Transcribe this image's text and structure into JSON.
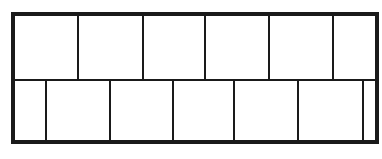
{
  "figure": {
    "caption": "",
    "background_color": "#ffffff",
    "stroke_color": "#1a1a1a",
    "outer_stroke_width": 3.2,
    "inner_stroke_width": 2.2,
    "bounds": {
      "left": 13,
      "top": 14,
      "right": 377,
      "bottom": 142,
      "width": 364,
      "height": 128
    },
    "horizontal_dividers": [
      {
        "name": "middle-divider",
        "y": 80
      }
    ],
    "rows": [
      {
        "name": "upper-row",
        "top": 14,
        "bottom": 80,
        "cell_count": 6,
        "dividers": [
          78,
          143,
          205,
          269,
          333
        ],
        "cells": [
          {
            "name": "upper-cell-1",
            "left": 13,
            "right": 78,
            "width": 65
          },
          {
            "name": "upper-cell-2",
            "left": 78,
            "right": 143,
            "width": 65
          },
          {
            "name": "upper-cell-3",
            "left": 143,
            "right": 205,
            "width": 62
          },
          {
            "name": "upper-cell-4",
            "left": 205,
            "right": 269,
            "width": 64
          },
          {
            "name": "upper-cell-5",
            "left": 269,
            "right": 333,
            "width": 64
          },
          {
            "name": "upper-cell-6",
            "left": 333,
            "right": 377,
            "width": 44
          }
        ]
      },
      {
        "name": "lower-row",
        "top": 80,
        "bottom": 142,
        "cell_count": 7,
        "dividers": [
          46,
          110,
          173,
          234,
          298,
          363
        ],
        "cells": [
          {
            "name": "lower-cell-1",
            "left": 13,
            "right": 46,
            "width": 33
          },
          {
            "name": "lower-cell-2",
            "left": 46,
            "right": 110,
            "width": 64
          },
          {
            "name": "lower-cell-3",
            "left": 110,
            "right": 173,
            "width": 63
          },
          {
            "name": "lower-cell-4",
            "left": 173,
            "right": 234,
            "width": 61
          },
          {
            "name": "lower-cell-5",
            "left": 234,
            "right": 298,
            "width": 64
          },
          {
            "name": "lower-cell-6",
            "left": 298,
            "right": 363,
            "width": 65
          },
          {
            "name": "lower-cell-7",
            "left": 363,
            "right": 377,
            "width": 14
          }
        ]
      }
    ]
  }
}
